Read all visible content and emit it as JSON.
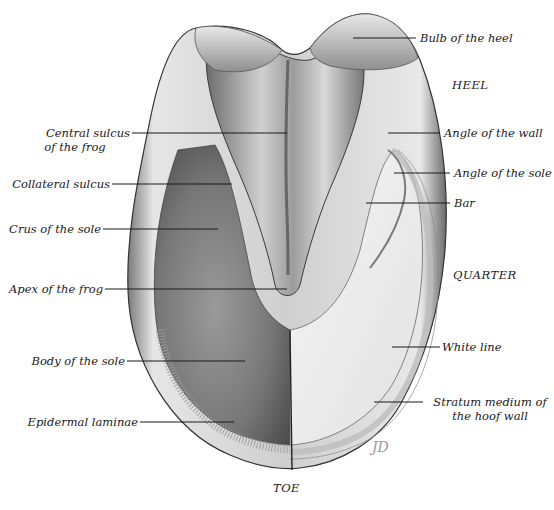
{
  "figure": {
    "signature": "JD"
  },
  "regions": {
    "heel": "HEEL",
    "quarter": "QUARTER",
    "toe": "TOE"
  },
  "labels_left": [
    {
      "id": "central-sulcus",
      "line1": "Central sulcus",
      "line2": "of the frog"
    },
    {
      "id": "collateral-sulcus",
      "line1": "Collateral sulcus"
    },
    {
      "id": "crus-of-sole",
      "line1": "Crus of the sole"
    },
    {
      "id": "apex-of-frog",
      "line1": "Apex of the frog"
    },
    {
      "id": "body-of-sole",
      "line1": "Body of the sole"
    },
    {
      "id": "epidermal-laminae",
      "line1": "Epidermal laminae"
    }
  ],
  "labels_right": [
    {
      "id": "bulb-of-heel",
      "line1": "Bulb of the heel"
    },
    {
      "id": "angle-of-wall",
      "line1": "Angle of the wall"
    },
    {
      "id": "angle-of-sole",
      "line1": "Angle of the sole"
    },
    {
      "id": "bar",
      "line1": "Bar"
    },
    {
      "id": "white-line",
      "line1": "White line"
    },
    {
      "id": "stratum-medium",
      "line1": "Stratum medium of",
      "line2": "the hoof wall"
    }
  ],
  "colors": {
    "ink": "#1a1a1a",
    "sole_dark": "#6f6f6f",
    "sole_light": "#efefef",
    "wall": "#d9d9d9"
  }
}
